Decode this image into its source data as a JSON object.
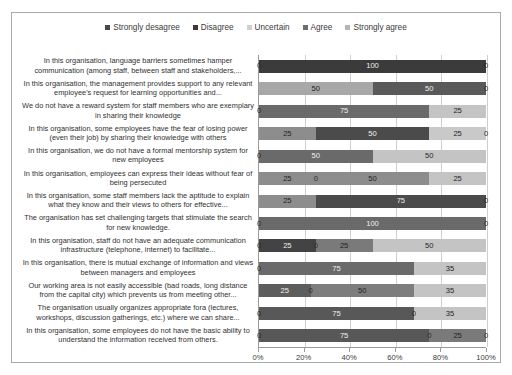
{
  "chart_data": {
    "type": "bar",
    "orientation": "horizontal",
    "stacked": true,
    "stacked_mode": "percent",
    "title": "",
    "xlabel": "",
    "ylabel": "",
    "xlim": [
      0,
      100
    ],
    "xticks": [
      "0%",
      "20%",
      "40%",
      "60%",
      "80%",
      "100%"
    ],
    "xtick_values": [
      0,
      20,
      40,
      60,
      80,
      100
    ],
    "grid": true,
    "legend_position": "top",
    "series": [
      {
        "name": "Strongly desagree",
        "color": "#4a4a4a"
      },
      {
        "name": "Disagree",
        "color": "#3b3b3b"
      },
      {
        "name": "Uncertain",
        "color": "#cfcfcf"
      },
      {
        "name": "Agree",
        "color": "#6e6e6e"
      },
      {
        "name": "Strongly agree",
        "color": "#b5b5b5"
      }
    ],
    "categories": [
      "In this organisation, language barriers sometimes hamper communication (among staff, between staff and stakeholders,...",
      "In this organisation, the management provides support to any relevant employee's request for learning opportunities and...",
      "We do not have a reward system for staff members who are exemplary in sharing their knowledge",
      "In this organisation, some employees have the fear of losing power (even their job) by sharing their knowledge with others",
      "In this organisation, we do not have a formal mentorship system for new employees",
      "In this organisation, employees can express their ideas without fear of being persecuted",
      "In this organisation, some staff members lack the aptitude to explain what they know and their views to others for effective...",
      "The organisation has set challenging targets that stimulate the search for new knowledge.",
      "In this organisation, staff do not have an adequate communication infrastructure (telephone, internet) to facilitate...",
      "In this organisation, there is mutual exchange of information and views between managers and employees",
      "Our working area is not easily accessible (bad roads, long distance from the capital city) which prevents us from meeting other...",
      "The organisation usually organizes appropriate fora (lectures, workshops, discussion gatherings, etc.) where we can share...",
      "In this organisation, some employees do not have the basic ability to understand the information received from others."
    ],
    "rows": [
      {
        "segments": [
          {
            "series": "Strongly desagree",
            "value": 0,
            "label": "0",
            "color": "#4a4a4a"
          },
          {
            "series": "Disagree",
            "value": 100,
            "label": "100",
            "color": "#3b3b3b"
          },
          {
            "series": "Uncertain",
            "value": 0,
            "label": "",
            "color": "#cfcfcf"
          },
          {
            "series": "Agree",
            "value": 0,
            "label": "0",
            "color": "#6e6e6e"
          },
          {
            "series": "Strongly agree",
            "value": 0,
            "label": "",
            "color": "#b5b5b5"
          }
        ]
      },
      {
        "segments": [
          {
            "series": "Strongly desagree",
            "value": 50,
            "label": "50",
            "color": "#a8a8a8"
          },
          {
            "series": "Disagree",
            "value": 50,
            "label": "50",
            "color": "#5a5a5a"
          },
          {
            "series": "Uncertain",
            "value": 0,
            "label": "",
            "color": "#cfcfcf"
          },
          {
            "series": "Agree",
            "value": 0,
            "label": "0",
            "color": "#6e6e6e"
          },
          {
            "series": "Strongly agree",
            "value": 0,
            "label": "",
            "color": "#b5b5b5"
          }
        ]
      },
      {
        "segments": [
          {
            "series": "Strongly desagree",
            "value": 0,
            "label": "0",
            "color": "#4a4a4a"
          },
          {
            "series": "Disagree",
            "value": 75,
            "label": "75",
            "color": "#6a6a6a"
          },
          {
            "series": "Uncertain",
            "value": 25,
            "label": "25",
            "color": "#c4c4c4"
          },
          {
            "series": "Agree",
            "value": 0,
            "label": "",
            "color": "#6e6e6e"
          },
          {
            "series": "Strongly agree",
            "value": 0,
            "label": "",
            "color": "#b5b5b5"
          }
        ]
      },
      {
        "segments": [
          {
            "series": "Strongly desagree",
            "value": 25,
            "label": "25",
            "color": "#8d8d8d"
          },
          {
            "series": "Disagree",
            "value": 50,
            "label": "50",
            "color": "#4b4b4b"
          },
          {
            "series": "Uncertain",
            "value": 25,
            "label": "25",
            "color": "#c9c9c9"
          },
          {
            "series": "Agree",
            "value": 0,
            "label": "0",
            "color": "#6e6e6e"
          },
          {
            "series": "Strongly agree",
            "value": 0,
            "label": "",
            "color": "#b5b5b5"
          }
        ]
      },
      {
        "segments": [
          {
            "series": "Strongly desagree",
            "value": 0,
            "label": "0",
            "color": "#4a4a4a"
          },
          {
            "series": "Disagree",
            "value": 50,
            "label": "50",
            "color": "#6a6a6a"
          },
          {
            "series": "Uncertain",
            "value": 50,
            "label": "50",
            "color": "#c4c4c4"
          },
          {
            "series": "Agree",
            "value": 0,
            "label": "",
            "color": "#6e6e6e"
          },
          {
            "series": "Strongly agree",
            "value": 0,
            "label": "",
            "color": "#b5b5b5"
          }
        ]
      },
      {
        "segments": [
          {
            "series": "Strongly desagree",
            "value": 25,
            "label": "25",
            "color": "#8d8d8d"
          },
          {
            "series": "Disagree",
            "value": 0,
            "label": "0",
            "color": "#3b3b3b"
          },
          {
            "series": "Uncertain",
            "value": 50,
            "label": "50",
            "color": "#8d8d8d"
          },
          {
            "series": "Agree",
            "value": 25,
            "label": "25",
            "color": "#c4c4c4"
          },
          {
            "series": "Strongly agree",
            "value": 0,
            "label": "",
            "color": "#b5b5b5"
          }
        ]
      },
      {
        "segments": [
          {
            "series": "Strongly desagree",
            "value": 25,
            "label": "25",
            "color": "#8d8d8d"
          },
          {
            "series": "Disagree",
            "value": 75,
            "label": "75",
            "color": "#4b4b4b"
          },
          {
            "series": "Uncertain",
            "value": 0,
            "label": "0",
            "color": "#cfcfcf"
          },
          {
            "series": "Agree",
            "value": 0,
            "label": "",
            "color": "#6e6e6e"
          },
          {
            "series": "Strongly agree",
            "value": 0,
            "label": "",
            "color": "#b5b5b5"
          }
        ]
      },
      {
        "segments": [
          {
            "series": "Strongly desagree",
            "value": 0,
            "label": "0",
            "color": "#4a4a4a"
          },
          {
            "series": "Disagree",
            "value": 100,
            "label": "100",
            "color": "#6a6a6a"
          },
          {
            "series": "Uncertain",
            "value": 0,
            "label": "0",
            "color": "#cfcfcf"
          },
          {
            "series": "Agree",
            "value": 0,
            "label": "",
            "color": "#6e6e6e"
          },
          {
            "series": "Strongly agree",
            "value": 0,
            "label": "",
            "color": "#b5b5b5"
          }
        ]
      },
      {
        "segments": [
          {
            "series": "Strongly desagree",
            "value": 0,
            "label": "0",
            "color": "#4a4a4a"
          },
          {
            "series": "Disagree",
            "value": 25,
            "label": "25",
            "color": "#434343"
          },
          {
            "series": "Uncertain",
            "value": 0,
            "label": "0",
            "color": "#5a5a5a"
          },
          {
            "series": "Agree",
            "value": 25,
            "label": "25",
            "color": "#7a7a7a"
          },
          {
            "series": "Strongly agree",
            "value": 50,
            "label": "50",
            "color": "#c4c4c4"
          }
        ]
      },
      {
        "segments": [
          {
            "series": "Strongly desagree",
            "value": 0,
            "label": "0",
            "color": "#4a4a4a"
          },
          {
            "series": "Disagree",
            "value": 75,
            "label": "75",
            "color": "#6a6a6a"
          },
          {
            "series": "Uncertain",
            "value": 35,
            "label": "35",
            "color": "#c4c4c4"
          },
          {
            "series": "Agree",
            "value": 0,
            "label": "",
            "color": "#6e6e6e"
          },
          {
            "series": "Strongly agree",
            "value": 0,
            "label": "",
            "color": "#b5b5b5"
          }
        ]
      },
      {
        "segments": [
          {
            "series": "Strongly desagree",
            "value": 25,
            "label": "25",
            "color": "#5d5d5d"
          },
          {
            "series": "Disagree",
            "value": 0,
            "label": "0",
            "color": "#3b3b3b"
          },
          {
            "series": "Uncertain",
            "value": 50,
            "label": "50",
            "color": "#7d7d7d"
          },
          {
            "series": "Agree",
            "value": 35,
            "label": "35",
            "color": "#c4c4c4"
          },
          {
            "series": "Strongly agree",
            "value": 0,
            "label": "",
            "color": "#b5b5b5"
          }
        ]
      },
      {
        "segments": [
          {
            "series": "Strongly desagree",
            "value": 0,
            "label": "0",
            "color": "#4a4a4a"
          },
          {
            "series": "Disagree",
            "value": 75,
            "label": "75",
            "color": "#585858"
          },
          {
            "series": "Uncertain",
            "value": 0,
            "label": "0",
            "color": "#cfcfcf"
          },
          {
            "series": "Agree",
            "value": 35,
            "label": "35",
            "color": "#c4c4c4"
          },
          {
            "series": "Strongly agree",
            "value": 0,
            "label": "",
            "color": "#b5b5b5"
          }
        ]
      },
      {
        "segments": [
          {
            "series": "Strongly desagree",
            "value": 0,
            "label": "0",
            "color": "#4a4a4a"
          },
          {
            "series": "Disagree",
            "value": 75,
            "label": "75",
            "color": "#585858"
          },
          {
            "series": "Uncertain",
            "value": 0,
            "label": "0",
            "color": "#cfcfcf"
          },
          {
            "series": "Agree",
            "value": 25,
            "label": "25",
            "color": "#7a7a7a"
          },
          {
            "series": "Strongly agree",
            "value": 0,
            "label": "0",
            "color": "#b5b5b5"
          }
        ]
      }
    ]
  }
}
